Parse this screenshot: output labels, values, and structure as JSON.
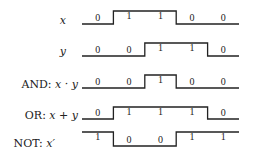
{
  "diagram": {
    "rows": [
      {
        "id": "x",
        "label_prefix": "",
        "label_expr": "x",
        "bits": [
          "0",
          "1",
          "1",
          "0",
          "0"
        ]
      },
      {
        "id": "y",
        "label_prefix": "",
        "label_expr": "y",
        "bits": [
          "0",
          "0",
          "1",
          "1",
          "0"
        ]
      },
      {
        "id": "and",
        "label_prefix": "AND: ",
        "label_expr": "x · y",
        "bits": [
          "0",
          "0",
          "1",
          "0",
          "0"
        ]
      },
      {
        "id": "or",
        "label_prefix": "OR: ",
        "label_expr": "x + y",
        "bits": [
          "0",
          "1",
          "1",
          "1",
          "0"
        ]
      },
      {
        "id": "not",
        "label_prefix": "NOT: ",
        "label_expr": "x′",
        "bits": [
          "1",
          "0",
          "0",
          "1",
          "1"
        ]
      }
    ]
  }
}
